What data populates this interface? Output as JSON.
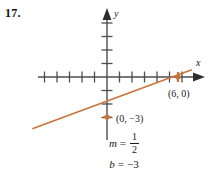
{
  "problem": {
    "number": "17."
  },
  "graph": {
    "axes": {
      "x_label": "x",
      "y_label": "y",
      "x_axis_color": "#4d4d4d",
      "y_axis_color": "#4d4d4d",
      "origin_px": {
        "x": 107,
        "y": 77
      },
      "tick_spacing_x_px": 12.5,
      "tick_spacing_y_px": 13.5,
      "x_ticks_left": 5,
      "x_ticks_right": 6,
      "y_ticks_up": 4,
      "y_ticks_down": 3
    },
    "line": {
      "color": "#c8763c",
      "slope": 0.5,
      "y_intercept": -3,
      "start_px": {
        "x": 33,
        "y": 128
      },
      "end_px": {
        "x": 190,
        "y": 70
      }
    },
    "points": [
      {
        "label": "(0, −3)",
        "x": 0,
        "y": -3,
        "marker_px": {
          "x": 107,
          "y": 117
        },
        "label_px": {
          "x": 116,
          "y": 121
        },
        "marker_color": "#c8763c"
      },
      {
        "label": "(6, 0)",
        "x": 6,
        "y": 0,
        "marker_px": {
          "x": 178,
          "y": 77
        },
        "label_px": {
          "x": 169,
          "y": 96
        },
        "marker_color": "#c8763c"
      }
    ]
  },
  "equations": {
    "slope": {
      "variable": "m",
      "equals": "=",
      "numerator": "1",
      "denominator": "2"
    },
    "intercept": {
      "variable": "b",
      "equals": "=",
      "value": "−3"
    }
  }
}
